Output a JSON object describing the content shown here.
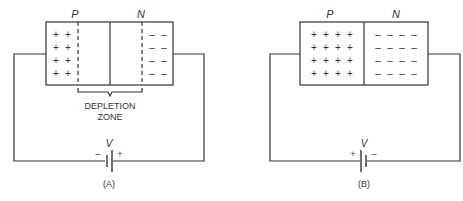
{
  "diagram_a": {
    "p_label": "P",
    "n_label": "N",
    "p_charge": "+",
    "n_charge": "–",
    "depletion_line1": "DEPLETION",
    "depletion_line2": "ZONE",
    "voltage_label": "V",
    "battery_left_sign": "–",
    "battery_right_sign": "+",
    "caption": "(A)"
  },
  "diagram_b": {
    "p_label": "P",
    "n_label": "N",
    "p_charge": "+",
    "n_charge": "–",
    "voltage_label": "V",
    "battery_left_sign": "+",
    "battery_right_sign": "–",
    "caption": "(B)"
  }
}
